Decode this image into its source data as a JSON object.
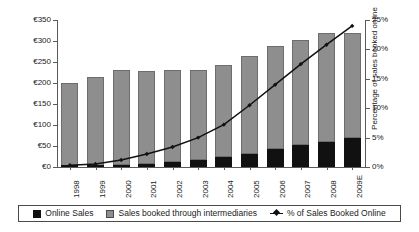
{
  "chart_data": {
    "type": "bar",
    "title": "",
    "xlabel": "",
    "ylabel": "Billions",
    "y2label": "Percentage of sales booked online",
    "ylim": [
      0,
      350
    ],
    "y2lim": [
      0,
      25
    ],
    "grid": false,
    "legend_position": "bottom",
    "categories": [
      "1998",
      "1999",
      "2000",
      "2001",
      "2002",
      "2003",
      "2004",
      "2005",
      "2006",
      "2007",
      "2008",
      "2009E"
    ],
    "y_ticks": [
      "€0",
      "€50",
      "€100",
      "€150",
      "€200",
      "€250",
      "€300",
      "€350"
    ],
    "y_tick_values": [
      0,
      50,
      100,
      150,
      200,
      250,
      300,
      350
    ],
    "y2_ticks": [
      "0%",
      "5%",
      "10%",
      "15%",
      "20%",
      "25%"
    ],
    "y2_tick_values": [
      0,
      5,
      10,
      15,
      20,
      25
    ],
    "series": [
      {
        "name": "Online Sales",
        "type": "bar",
        "stack": "total",
        "color": "#111111",
        "values": [
          1,
          2,
          4,
          7,
          11,
          16,
          23,
          32,
          43,
          52,
          60,
          68
        ]
      },
      {
        "name": "Sales booked through intermediaries",
        "type": "bar",
        "stack": "total",
        "color": "#8e8e8e",
        "values": [
          199,
          212,
          226,
          222,
          219,
          214,
          220,
          233,
          245,
          251,
          260,
          252
        ]
      },
      {
        "name": "% of Sales Booked Online",
        "type": "line",
        "axis": "right",
        "color": "#111111",
        "values": [
          0.3,
          0.5,
          1.2,
          2.2,
          3.4,
          5.0,
          7.2,
          10.5,
          14.0,
          17.5,
          20.8,
          24.0
        ]
      }
    ],
    "totals": [
      200,
      214,
      230,
      229,
      230,
      230,
      243,
      265,
      288,
      303,
      320,
      320
    ]
  },
  "legend": {
    "items": [
      {
        "label": "Online Sales",
        "icon": "black-square-swatch"
      },
      {
        "label": "Sales booked through intermediaries",
        "icon": "gray-square-swatch"
      },
      {
        "label": "% of Sales Booked Online",
        "icon": "line-marker-swatch"
      }
    ]
  }
}
